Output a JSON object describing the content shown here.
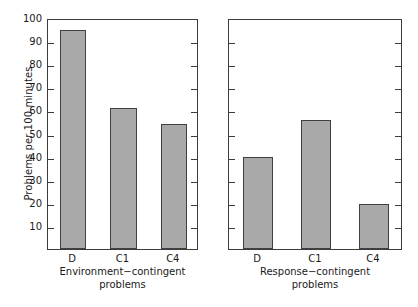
{
  "chart_data": {
    "type": "bar",
    "title": "",
    "xlabel": "",
    "ylabel": "Problems per 100 minutes",
    "ylim": [
      0,
      100
    ],
    "yticks": [
      10,
      20,
      30,
      40,
      50,
      60,
      70,
      80,
      90,
      100
    ],
    "ytick_labels": [
      "10",
      "20",
      "30",
      "40",
      "50",
      "60",
      "70",
      "80",
      "90",
      "100"
    ],
    "grid": false,
    "legend": null,
    "bar_color": "#a9a9a9",
    "bar_edge_color": "#404040",
    "axis_color": "#3c3c3c",
    "panels": [
      {
        "name": "environment-contingent",
        "caption_line1": "Environment−contingent",
        "caption_line2": "problems",
        "categories": [
          "D",
          "C1",
          "C4"
        ],
        "values": [
          95,
          61,
          54
        ]
      },
      {
        "name": "response-contingent",
        "caption_line1": "Response−contingent",
        "caption_line2": "problems",
        "categories": [
          "D",
          "C1",
          "C4"
        ],
        "values": [
          40,
          56,
          19.5
        ]
      }
    ]
  }
}
